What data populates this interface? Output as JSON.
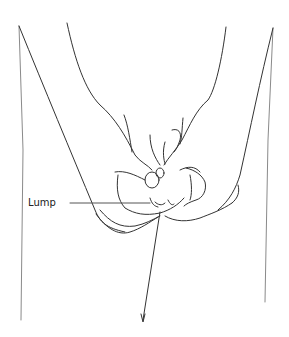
{
  "figure": {
    "labels": [
      {
        "text": "Lump",
        "x": 28,
        "y": 197
      }
    ],
    "colors": {
      "background": "#ffffff",
      "stroke": "#333333",
      "faint_stroke": "#8a8a8a",
      "label_text": "#222222"
    }
  }
}
